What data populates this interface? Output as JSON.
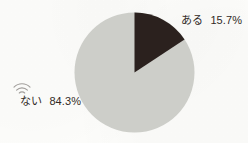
{
  "figure": {
    "background_color": "#fdfdfb"
  },
  "chart_data": {
    "type": "pie",
    "title": "",
    "subtitle": "",
    "xlabel": "",
    "ylabel": "",
    "grid": false,
    "legend_position": "outside-labels",
    "unit": "%",
    "categories": [
      "ある",
      "ない"
    ],
    "values": [
      15.7,
      84.3
    ],
    "start_angle_deg": 0,
    "direction": "clockwise",
    "slices": [
      {
        "label": "ある",
        "value": 15.7,
        "value_text": "15.7%",
        "color": "#2b211e",
        "start_angle_deg": 0,
        "end_angle_deg": 56.52,
        "label_position": "top-right"
      },
      {
        "label": "ない",
        "value": 84.3,
        "value_text": "84.3%",
        "color": "#cdcec9",
        "start_angle_deg": 56.52,
        "end_angle_deg": 360,
        "label_position": "bottom-left"
      }
    ],
    "geometry": {
      "center_x": 134,
      "center_y": 72,
      "radius": 60
    }
  },
  "labels": {
    "aru": {
      "name": "ある",
      "percent": "15.7%"
    },
    "nai": {
      "name": "ない",
      "percent": "84.3%"
    }
  },
  "icons": {
    "scan_artifact": "signal-arc-icon"
  }
}
